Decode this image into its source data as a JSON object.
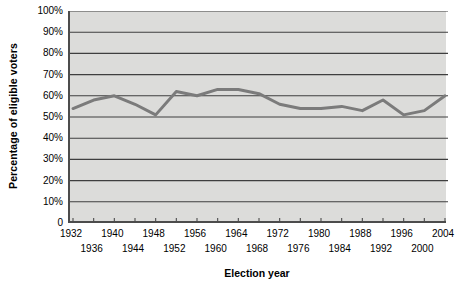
{
  "chart_data": {
    "type": "line",
    "title": "",
    "xlabel": "Election year",
    "ylabel": "Percentage of eligible voters",
    "xlim": [
      1932,
      2004
    ],
    "ylim": [
      0,
      100
    ],
    "grid": true,
    "legend": null,
    "y_ticks": [
      "100%",
      "90%",
      "80%",
      "70%",
      "60%",
      "50%",
      "40%",
      "30%",
      "20%",
      "10%",
      "0"
    ],
    "y_tick_values": [
      100,
      90,
      80,
      70,
      60,
      50,
      40,
      30,
      20,
      10,
      0
    ],
    "x_ticks": [
      "1932",
      "1936",
      "1940",
      "1944",
      "1948",
      "1952",
      "1956",
      "1960",
      "1964",
      "1968",
      "1972",
      "1976",
      "1980",
      "1984",
      "1988",
      "1992",
      "1996",
      "2000",
      "2004"
    ],
    "categories": [
      1932,
      1936,
      1940,
      1944,
      1948,
      1952,
      1956,
      1960,
      1964,
      1968,
      1972,
      1976,
      1980,
      1984,
      1988,
      1992,
      1996,
      2000,
      2004
    ],
    "values": [
      54,
      58,
      60,
      56,
      51,
      62,
      60,
      63,
      63,
      61,
      56,
      54,
      54,
      55,
      53,
      58,
      51,
      53,
      60
    ],
    "series": [
      {
        "name": "Voter turnout",
        "color": "#7b7b7b",
        "values": [
          54,
          58,
          60,
          56,
          51,
          62,
          60,
          63,
          63,
          61,
          56,
          54,
          54,
          55,
          53,
          58,
          51,
          53,
          60
        ]
      }
    ],
    "plot_background": "#dcdcda",
    "line_color": "#7b7b7b",
    "grid_color": "#3f3f3f",
    "axis_color": "#4c4c4c"
  }
}
